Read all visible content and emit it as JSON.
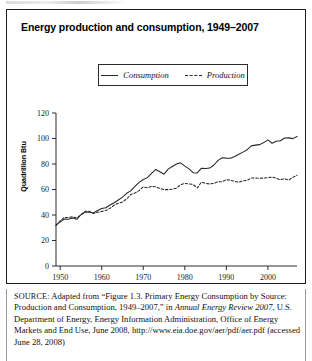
{
  "figure": {
    "title": "Energy production and consumption, 1949–2007"
  },
  "source_note": {
    "label": "SOURCE:",
    "text_1": " Adapted from “Figure 1.3. Primary Energy Consumption by Source: Production and Consumption, 1949–2007,” in ",
    "italic_1": "Annual Energy Review 2007",
    "text_2": ", U.S. Department of Energy, Energy Information Administration, Office of Energy Markets and End Use, June 2008, http://www.eia.doe.gov/aer/pdf/aer.pdf (accessed June 28, 2008)"
  },
  "chart_data": {
    "type": "line",
    "title": "Energy production and consumption, 1949–2007",
    "xlabel": "",
    "ylabel": "Quadrillion Btu",
    "xlim": [
      1949,
      2007
    ],
    "ylim": [
      0,
      120
    ],
    "yticks": [
      0,
      20,
      40,
      60,
      80,
      100,
      120
    ],
    "ytick_labels": [
      "0",
      "20",
      "40",
      "60",
      "80",
      "100",
      "120"
    ],
    "xticks": [
      1950,
      1960,
      1970,
      1980,
      1990,
      2000
    ],
    "xtick_labels": [
      "1950",
      "1960",
      "1970",
      "1980",
      "1990",
      "2000"
    ],
    "grid": false,
    "legend_position": "top-center",
    "x": [
      1949,
      1950,
      1951,
      1952,
      1953,
      1954,
      1955,
      1956,
      1957,
      1958,
      1959,
      1960,
      1961,
      1962,
      1963,
      1964,
      1965,
      1966,
      1967,
      1968,
      1969,
      1970,
      1971,
      1972,
      1973,
      1974,
      1975,
      1976,
      1977,
      1978,
      1979,
      1980,
      1981,
      1982,
      1983,
      1984,
      1985,
      1986,
      1987,
      1988,
      1989,
      1990,
      1991,
      1992,
      1993,
      1994,
      1995,
      1996,
      1997,
      1998,
      1999,
      2000,
      2001,
      2002,
      2003,
      2004,
      2005,
      2006,
      2007
    ],
    "series": [
      {
        "name": "Consumption",
        "style": "solid",
        "color": "#262626",
        "values": [
          32.0,
          34.6,
          36.9,
          36.7,
          37.7,
          36.6,
          40.2,
          42.1,
          42.4,
          41.6,
          43.5,
          45.1,
          45.7,
          47.8,
          49.6,
          51.8,
          54.0,
          57.0,
          58.9,
          62.4,
          65.6,
          67.8,
          69.3,
          72.7,
          75.7,
          73.9,
          72.0,
          76.0,
          78.0,
          80.0,
          80.9,
          78.3,
          76.2,
          73.2,
          73.0,
          76.7,
          76.5,
          76.8,
          79.2,
          82.8,
          84.9,
          84.6,
          84.5,
          85.9,
          87.6,
          89.3,
          91.2,
          94.2,
          94.8,
          95.2,
          96.8,
          98.9,
          96.3,
          97.9,
          98.2,
          100.4,
          100.5,
          99.9,
          101.6
        ]
      },
      {
        "name": "Production",
        "style": "dashed",
        "color": "#262626",
        "values": [
          31.7,
          35.5,
          38.1,
          38.0,
          38.6,
          37.7,
          40.1,
          42.9,
          43.0,
          41.2,
          42.1,
          42.8,
          43.5,
          45.3,
          47.7,
          49.3,
          50.2,
          52.6,
          56.1,
          57.2,
          59.1,
          62.1,
          61.3,
          62.4,
          62.1,
          60.8,
          59.9,
          59.9,
          60.2,
          61.1,
          63.8,
          64.8,
          64.4,
          63.9,
          61.2,
          65.8,
          64.9,
          64.3,
          64.8,
          66.1,
          66.0,
          67.8,
          67.2,
          66.5,
          65.6,
          66.9,
          67.1,
          69.0,
          69.0,
          68.8,
          69.0,
          69.3,
          69.8,
          68.8,
          67.6,
          68.5,
          67.4,
          69.5,
          71.2
        ]
      }
    ]
  },
  "legend": {
    "entries": [
      {
        "label": "Consumption",
        "style": "solid"
      },
      {
        "label": "Production",
        "style": "dashed"
      }
    ]
  }
}
